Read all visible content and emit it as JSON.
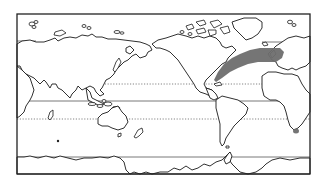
{
  "map": {
    "type": "world-map-pacific-centered",
    "frame": {
      "x": 17,
      "y": 14,
      "width": 293,
      "height": 160
    },
    "colors": {
      "outline": "#1a1a1a",
      "highlight": "#6e6e6e",
      "background": "#ffffff"
    },
    "reference_lines": [
      {
        "name": "tropic-of-cancer",
        "style": "dotted",
        "y": 84
      },
      {
        "name": "equator",
        "style": "solid",
        "y": 101
      },
      {
        "name": "tropic-of-capricorn",
        "style": "dotted",
        "y": 119
      },
      {
        "name": "antarctic-circle",
        "style": "solid",
        "y": 157
      }
    ],
    "highlighted_regions": [
      {
        "name": "north-atlantic-band",
        "description": "Shaded band from Gulf of Mexico / US east coast across the North Atlantic to Western Europe"
      },
      {
        "name": "southern-africa-tip",
        "description": "Small shaded spot at southeastern tip of Africa"
      }
    ]
  }
}
